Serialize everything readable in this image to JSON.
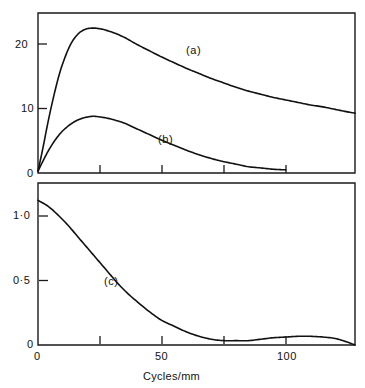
{
  "chart_data": {
    "type": "line",
    "title": "",
    "subtitle": "",
    "xlabel": "Cycles/mm",
    "panels": [
      {
        "name": "upper-panel",
        "ylabel": "",
        "xlim": [
          0,
          128
        ],
        "ylim": [
          0,
          25.4
        ],
        "grid": false,
        "x_ticks": [
          0,
          25,
          50,
          75,
          100,
          125
        ],
        "x_tick_labels": [
          "",
          "",
          "",
          "",
          "",
          ""
        ],
        "y_ticks": [
          0,
          10,
          20
        ],
        "y_tick_labels": [
          "0",
          "10",
          "20"
        ],
        "series": [
          {
            "name": "(a)",
            "label": "(a)",
            "color": "#111111",
            "x": [
              0,
              2,
              4,
              6,
              8,
              10,
              13,
              16,
              19,
              22,
              25,
              28,
              31,
              35,
              40,
              45,
              50,
              55,
              60,
              65,
              70,
              75,
              80,
              85,
              90,
              95,
              100,
              105,
              110,
              115,
              120,
              125,
              128
            ],
            "y": [
              0.3,
              4.0,
              8.0,
              11.6,
              14.8,
              17.4,
              20.3,
              22.0,
              22.8,
              23.0,
              22.9,
              22.6,
              22.2,
              21.5,
              20.4,
              19.4,
              18.4,
              17.5,
              16.6,
              15.8,
              15.0,
              14.3,
              13.6,
              13.0,
              12.5,
              12.0,
              11.6,
              11.2,
              10.8,
              10.5,
              10.1,
              9.7,
              9.5
            ]
          },
          {
            "name": "(b)",
            "label": "(b)",
            "color": "#111111",
            "x": [
              0,
              2,
              4,
              6,
              8,
              10,
              13,
              16,
              19,
              22,
              25,
              28,
              31,
              35,
              40,
              45,
              50,
              55,
              60,
              65,
              70,
              75,
              80,
              85,
              90,
              95,
              100
            ],
            "y": [
              0.3,
              1.9,
              3.4,
              4.7,
              5.8,
              6.7,
              7.7,
              8.4,
              8.8,
              9.0,
              8.9,
              8.7,
              8.4,
              7.9,
              7.0,
              6.1,
              5.2,
              4.4,
              3.6,
              2.9,
              2.3,
              1.8,
              1.4,
              1.0,
              0.8,
              0.6,
              0.5
            ]
          }
        ]
      },
      {
        "name": "lower-panel",
        "ylabel": "",
        "xlim": [
          0,
          128
        ],
        "ylim": [
          0,
          1.12
        ],
        "grid": false,
        "x_ticks": [
          0,
          25,
          50,
          75,
          100,
          125
        ],
        "x_tick_labels": [
          "0",
          "",
          "50",
          "",
          "100",
          ""
        ],
        "y_ticks": [
          0,
          0.5,
          1.0
        ],
        "y_tick_labels": [
          "0",
          "0·5",
          "1·0"
        ],
        "series": [
          {
            "name": "(c)",
            "label": "(c)",
            "color": "#111111",
            "x": [
              0,
              4,
              8,
              12,
              16,
              20,
              24,
              28,
              32,
              36,
              40,
              45,
              50,
              55,
              60,
              65,
              70,
              75,
              80,
              85,
              90,
              95,
              100,
              105,
              110,
              115,
              120,
              124,
              128
            ],
            "y": [
              1.0,
              0.96,
              0.9,
              0.83,
              0.75,
              0.67,
              0.59,
              0.51,
              0.43,
              0.36,
              0.3,
              0.23,
              0.17,
              0.13,
              0.09,
              0.06,
              0.04,
              0.03,
              0.03,
              0.03,
              0.04,
              0.05,
              0.055,
              0.06,
              0.06,
              0.055,
              0.045,
              0.025,
              0.0
            ]
          }
        ]
      }
    ]
  },
  "labels": {
    "upper_y": [
      "20",
      "10",
      "0"
    ],
    "lower_y": [
      "1·0",
      "0·5",
      "0"
    ],
    "lower_x": [
      "0",
      "50",
      "100"
    ],
    "x_axis_title": "Cycles/mm",
    "curve_a": "(a)",
    "curve_b": "(b)",
    "curve_c": "(c)"
  },
  "style": {
    "line_color": "#111111",
    "frame_color": "#1a1a1a",
    "background": "#ffffff"
  }
}
